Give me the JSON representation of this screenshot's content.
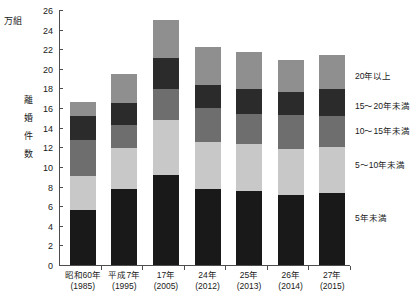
{
  "chart_data": {
    "type": "bar",
    "stacked": true,
    "title": "",
    "xlabel": "",
    "ylabel": "離婚件数",
    "yunit": "万組",
    "ylim": [
      0,
      26
    ],
    "ytick_step": 2,
    "yticks": [
      0,
      2,
      4,
      6,
      8,
      10,
      12,
      14,
      16,
      18,
      20,
      22,
      24,
      26
    ],
    "grid": false,
    "legend_position": "right",
    "categories": [
      "昭和60年（1985）",
      "平成7年（1995）",
      "17年（2005）",
      "24年（2012）",
      "25年（2013）",
      "26年（2014）",
      "27年（2015）"
    ],
    "series": [
      {
        "name": "5年未満",
        "color": "#191919",
        "values": [
          5.6,
          7.7,
          9.2,
          7.7,
          7.5,
          7.1,
          7.3
        ]
      },
      {
        "name": "5～10年未満",
        "color": "#c8c8c8",
        "values": [
          3.5,
          4.2,
          5.6,
          4.8,
          4.8,
          4.7,
          4.7
        ]
      },
      {
        "name": "10～15年未満",
        "color": "#6e6e6e",
        "values": [
          3.6,
          2.4,
          3.1,
          3.5,
          3.1,
          3.5,
          3.2
        ]
      },
      {
        "name": "15～20年未満",
        "color": "#2b2b2b",
        "values": [
          2.5,
          2.2,
          3.2,
          2.4,
          2.5,
          2.3,
          2.7
        ]
      },
      {
        "name": "20年以上",
        "color": "#8f8f8f",
        "values": [
          1.4,
          3.0,
          3.9,
          3.8,
          3.8,
          3.3,
          3.5
        ]
      }
    ],
    "totals": [
      16.6,
      19.5,
      25.0,
      22.2,
      21.7,
      20.9,
      21.4
    ]
  },
  "axis": {
    "unit_caption": "万組",
    "y_title_chars": [
      "離",
      "婚",
      "件",
      "数"
    ]
  },
  "xlabels": [
    {
      "era": "昭和60年",
      "west": "(1985)"
    },
    {
      "era": "平成7年",
      "west": "(1995)"
    },
    {
      "era": "17年",
      "west": "(2005)"
    },
    {
      "era": "24年",
      "west": "(2012)"
    },
    {
      "era": "25年",
      "west": "(2013)"
    },
    {
      "era": "26年",
      "west": "(2014)"
    },
    {
      "era": "27年",
      "west": "(2015)"
    }
  ],
  "legend": [
    {
      "label": "20年以上",
      "top": 71
    },
    {
      "label": "15～20年未満",
      "top": 101
    },
    {
      "label": "10～15年未満",
      "top": 126
    },
    {
      "label": "5～10年未満",
      "top": 160
    },
    {
      "label": "5年未満",
      "top": 213
    }
  ]
}
